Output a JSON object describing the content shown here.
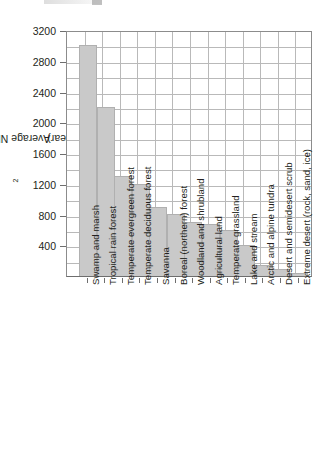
{
  "chart_data": {
    "type": "bar",
    "title": "",
    "xlabel": "",
    "ylabel": "Average NPP (g/m2/year)",
    "ylabel_parts": {
      "prefix": "Average NPP (g/m",
      "superscript": "2",
      "suffix": "/year)"
    },
    "ylim": [
      0,
      3200
    ],
    "yticks": [
      400,
      800,
      1200,
      1600,
      2000,
      2400,
      2800,
      3200
    ],
    "ytick_labels": [
      "400",
      "800",
      "1200",
      "1600",
      "2000",
      "2400",
      "2800",
      "3200"
    ],
    "grid": true,
    "legend": "none",
    "bar_color": "#c9c9c9",
    "bar_edge_color": "#b0b0b0",
    "grid_color": "#b9b9b9",
    "axis_color": "#6e6e6e",
    "text_color": "#231f20",
    "categories": [
      "Swamp and marsh",
      "Tropical rain forest",
      "Temperate evergreen forest",
      "Temperate deciduous forest",
      "Savanna",
      "Boreal (northern) forest",
      "Woodland and shrubland",
      "Agricultural land",
      "Temperate grassland",
      "Lake and stream",
      "Arctic and alpine tundra",
      "Desert and semidesert scrub",
      "Extreme desert (rock, sand, ice)"
    ],
    "values": [
      3000,
      2200,
      1300,
      1200,
      900,
      800,
      700,
      670,
      600,
      400,
      140,
      90,
      40
    ]
  }
}
